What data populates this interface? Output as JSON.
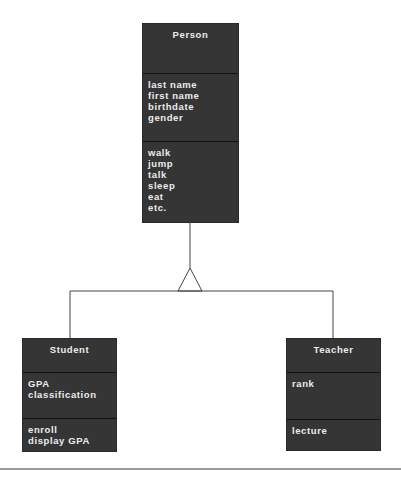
{
  "diagram": {
    "type": "UML class diagram (inheritance)",
    "colors": {
      "box_fill": "#353535",
      "box_text": "#ececec",
      "connector": "#444444",
      "rule": "#9a9a9a"
    },
    "parent": {
      "name": "Person",
      "attributes": [
        "last name",
        "first name",
        "birthdate",
        "gender"
      ],
      "methods": [
        "walk",
        "jump",
        "talk",
        "sleep",
        "eat",
        "etc."
      ]
    },
    "children": [
      {
        "name": "Student",
        "attributes": [
          "GPA",
          "classification"
        ],
        "methods": [
          "enroll",
          "display GPA"
        ]
      },
      {
        "name": "Teacher",
        "attributes": [
          "rank"
        ],
        "methods": [
          "lecture"
        ]
      }
    ],
    "relationship": "generalization (hollow triangle arrow pointing to Person)"
  }
}
